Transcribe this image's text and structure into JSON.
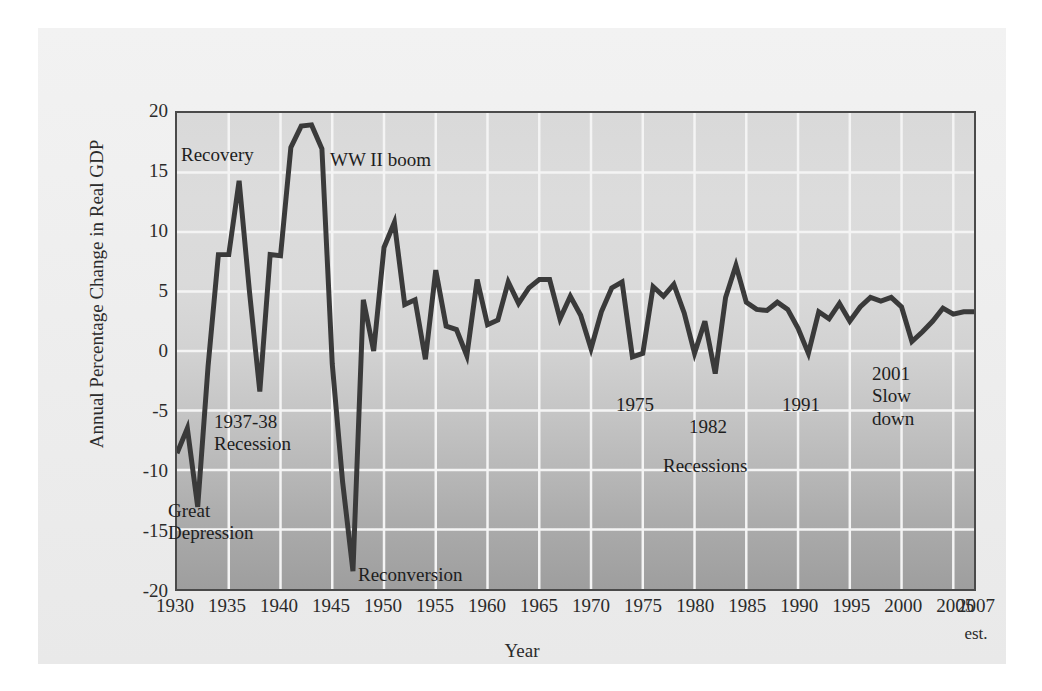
{
  "chart_data": {
    "type": "line",
    "title": "",
    "xlabel": "Year",
    "ylabel": "Annual Percentage Change in Real GDP",
    "xlim": [
      1930,
      2007
    ],
    "ylim": [
      -20,
      20
    ],
    "grid": true,
    "legend_position": "none",
    "x_tick_labels": [
      "1930",
      "1935",
      "1940",
      "1945",
      "1950",
      "1955",
      "1960",
      "1965",
      "1970",
      "1975",
      "1980",
      "1985",
      "1990",
      "1995",
      "2000",
      "2005",
      "2007"
    ],
    "x_tick_values": [
      1930,
      1935,
      1940,
      1945,
      1950,
      1955,
      1960,
      1965,
      1970,
      1975,
      1980,
      1985,
      1990,
      1995,
      2000,
      2005,
      2007
    ],
    "x_tick_note": "est.",
    "y_tick_labels": [
      "20",
      "15",
      "10",
      "5",
      "0",
      "-5",
      "-10",
      "-15",
      "-20"
    ],
    "y_tick_values": [
      20,
      15,
      10,
      5,
      0,
      -5,
      -10,
      -15,
      -20
    ],
    "line_color": "#3a3a3a",
    "plot_border_color": "#4a4a4a",
    "gridline_color": "#f4f4f4",
    "x": [
      1930,
      1931,
      1932,
      1933,
      1934,
      1935,
      1936,
      1937,
      1938,
      1939,
      1940,
      1941,
      1942,
      1943,
      1944,
      1945,
      1946,
      1947,
      1948,
      1949,
      1950,
      1951,
      1952,
      1953,
      1954,
      1955,
      1956,
      1957,
      1958,
      1959,
      1960,
      1961,
      1962,
      1963,
      1964,
      1965,
      1966,
      1967,
      1968,
      1969,
      1970,
      1971,
      1972,
      1973,
      1974,
      1975,
      1976,
      1977,
      1978,
      1979,
      1980,
      1981,
      1982,
      1983,
      1984,
      1985,
      1986,
      1987,
      1988,
      1989,
      1990,
      1991,
      1992,
      1993,
      1994,
      1995,
      1996,
      1997,
      1998,
      1999,
      2000,
      2001,
      2002,
      2003,
      2004,
      2005,
      2006,
      2007
    ],
    "values": [
      -8.6,
      -6.5,
      -13.1,
      -1.3,
      8.1,
      8.1,
      14.3,
      5.0,
      -3.4,
      8.1,
      8.0,
      17.1,
      18.9,
      19.0,
      17.0,
      -1.1,
      -11.0,
      -18.5,
      4.3,
      0.0,
      8.7,
      10.8,
      3.9,
      4.3,
      -0.7,
      6.8,
      2.1,
      1.8,
      -0.4,
      6.0,
      2.2,
      2.6,
      5.8,
      4.0,
      5.3,
      6.0,
      6.0,
      2.7,
      4.6,
      3.0,
      0.2,
      3.3,
      5.3,
      5.8,
      -0.5,
      -0.2,
      5.4,
      4.6,
      5.6,
      3.2,
      -0.2,
      2.5,
      -1.9,
      4.5,
      7.2,
      4.1,
      3.5,
      3.4,
      4.1,
      3.5,
      1.9,
      -0.2,
      3.3,
      2.7,
      4.0,
      2.5,
      3.7,
      4.5,
      4.2,
      4.5,
      3.7,
      0.8,
      1.6,
      2.5,
      3.6,
      3.1,
      3.3,
      3.3
    ],
    "annotations": [
      {
        "text": "Recovery",
        "x_px": 143,
        "y_px": 116
      },
      {
        "text": "WW II boom",
        "x_px": 292,
        "y_px": 121
      },
      {
        "text": "1937-38\nRecession",
        "x_px": 176,
        "y_px": 383
      },
      {
        "text": "Great\nDepression",
        "x_px": 130,
        "y_px": 472
      },
      {
        "text": "Reconversion",
        "x_px": 320,
        "y_px": 536
      },
      {
        "text": "1975",
        "x_px": 578,
        "y_px": 366
      },
      {
        "text": "1982",
        "x_px": 651,
        "y_px": 388
      },
      {
        "text": "Recessions",
        "x_px": 625,
        "y_px": 427
      },
      {
        "text": "1991",
        "x_px": 744,
        "y_px": 366
      },
      {
        "text": "2001\nSlow\ndown",
        "x_px": 834,
        "y_px": 335
      }
    ]
  }
}
